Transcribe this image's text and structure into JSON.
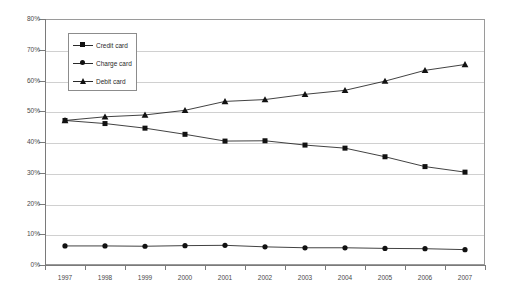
{
  "chart_data": {
    "type": "line",
    "title": "",
    "subtitle": "",
    "xlabel": "",
    "ylabel": "",
    "x": [
      "1997",
      "1998",
      "1999",
      "2000",
      "2001",
      "2002",
      "2003",
      "2004",
      "2005",
      "2006",
      "2007"
    ],
    "categories": [
      "1997",
      "1998",
      "1999",
      "2000",
      "2001",
      "2002",
      "2003",
      "2004",
      "2005",
      "2006",
      "2007"
    ],
    "ylim": [
      0,
      80
    ],
    "ytick_labels": [
      "0%",
      "10%",
      "20%",
      "30%",
      "40%",
      "50%",
      "60%",
      "70%",
      "80%"
    ],
    "ytick_values": [
      0,
      10,
      20,
      30,
      40,
      50,
      60,
      70,
      80
    ],
    "grid": true,
    "legend_position": "upper-left-inside",
    "series": [
      {
        "name": "Credit card",
        "marker": "square",
        "values": [
          47.0,
          46.0,
          44.5,
          42.5,
          40.3,
          40.4,
          39.0,
          38.0,
          35.2,
          32.0,
          30.2
        ]
      },
      {
        "name": "Charge card",
        "marker": "circle",
        "values": [
          6.2,
          6.2,
          6.1,
          6.3,
          6.4,
          5.9,
          5.6,
          5.6,
          5.4,
          5.3,
          5.0
        ]
      },
      {
        "name": "Debit card",
        "marker": "triangle",
        "values": [
          47.0,
          48.2,
          48.8,
          50.3,
          53.2,
          53.8,
          55.5,
          56.8,
          59.8,
          63.3,
          65.2
        ]
      }
    ]
  },
  "legend": {
    "items": [
      {
        "label": "Credit card",
        "marker": "square-marker-icon"
      },
      {
        "label": "Charge card",
        "marker": "circle-marker-icon"
      },
      {
        "label": "Debit card",
        "marker": "triangle-marker-icon"
      }
    ]
  },
  "colors": {
    "series": "#111111",
    "grid": "#d0d0d0",
    "axis": "#7a7a7a",
    "text": "#4a4a4a",
    "background": "#ffffff"
  }
}
